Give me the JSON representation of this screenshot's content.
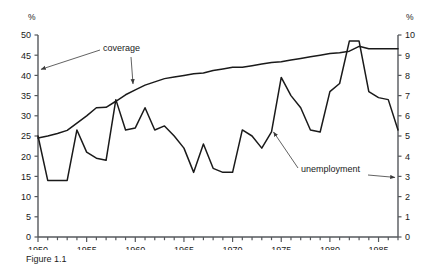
{
  "figure": {
    "caption": "Figure 1.1",
    "left_axis_unit": "%",
    "right_axis_unit": "%"
  },
  "annotations": [
    {
      "name": "coverage",
      "label": "coverage"
    },
    {
      "name": "unemployment",
      "label": "unemployment"
    }
  ],
  "chart_data": {
    "type": "line",
    "title": "",
    "xlabel": "",
    "ylabel": "%",
    "y2label": "%",
    "grid": false,
    "legend": "annotated-inline",
    "xlim": [
      1950,
      1987
    ],
    "ylim": [
      0,
      50
    ],
    "y2lim": [
      0,
      10
    ],
    "xticks": [
      1950,
      1951,
      1952,
      1953,
      1954,
      1955,
      1956,
      1957,
      1958,
      1959,
      1960,
      1961,
      1962,
      1963,
      1964,
      1965,
      1966,
      1967,
      1968,
      1969,
      1970,
      1971,
      1972,
      1973,
      1974,
      1975,
      1976,
      1977,
      1978,
      1979,
      1980,
      1981,
      1982,
      1983,
      1984,
      1985,
      1986,
      1987
    ],
    "xticklabels": [
      1950,
      1955,
      1960,
      1965,
      1970,
      1975,
      1980,
      1985
    ],
    "yticks": [
      0,
      5,
      10,
      15,
      20,
      25,
      30,
      35,
      40,
      45,
      50
    ],
    "y2ticks": [
      0,
      1,
      2,
      3,
      4,
      5,
      6,
      7,
      8,
      9,
      10
    ],
    "x": [
      1950,
      1951,
      1952,
      1953,
      1954,
      1955,
      1956,
      1957,
      1958,
      1959,
      1960,
      1961,
      1962,
      1963,
      1964,
      1965,
      1966,
      1967,
      1968,
      1969,
      1970,
      1971,
      1972,
      1973,
      1974,
      1975,
      1976,
      1977,
      1978,
      1979,
      1980,
      1981,
      1982,
      1983,
      1984,
      1985,
      1986,
      1987
    ],
    "series": [
      {
        "name": "coverage",
        "axis": "left",
        "color": "#1a1a1a",
        "values": [
          24.5,
          25.0,
          25.6,
          26.4,
          28.2,
          30.0,
          32.0,
          32.1,
          33.6,
          35.2,
          36.4,
          37.6,
          38.4,
          39.2,
          39.6,
          40.0,
          40.4,
          40.6,
          41.2,
          41.6,
          42.0,
          42.0,
          42.4,
          42.8,
          43.2,
          43.4,
          43.8,
          44.2,
          44.6,
          45.0,
          45.4,
          45.6,
          46.0,
          47.2,
          46.6,
          46.6,
          46.6,
          46.6
        ]
      },
      {
        "name": "unemployment",
        "axis": "right",
        "color": "#1a1a1a",
        "values": [
          5.0,
          2.8,
          2.8,
          2.8,
          5.3,
          4.2,
          3.9,
          3.8,
          6.8,
          5.3,
          5.4,
          6.4,
          5.3,
          5.5,
          5.0,
          4.4,
          3.2,
          4.6,
          3.4,
          3.2,
          3.2,
          5.3,
          5.0,
          4.4,
          5.2,
          7.9,
          7.0,
          6.4,
          5.3,
          5.2,
          7.2,
          7.6,
          9.7,
          9.7,
          7.2,
          6.9,
          6.8,
          5.3
        ]
      }
    ]
  }
}
